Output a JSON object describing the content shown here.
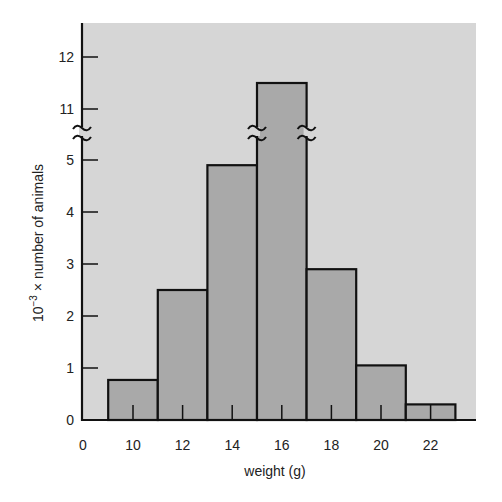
{
  "chart_data": {
    "type": "bar",
    "subtype": "histogram",
    "title": "",
    "xlabel": "weight (g)",
    "ylabel": "10⁻³ × number of animals",
    "ylabel_parts": {
      "base": "10",
      "exponent": "−3",
      "rest": " × number of animals"
    },
    "x_tick_labels": [
      "0",
      "10",
      "12",
      "14",
      "16",
      "18",
      "20",
      "22"
    ],
    "y_tick_labels": [
      "0",
      "1",
      "2",
      "3",
      "4",
      "5",
      "11",
      "12"
    ],
    "y_axis_break": {
      "from": 5,
      "to": 11,
      "note": "broken axis between 5 and 11"
    },
    "categories": [
      "9-11",
      "11-13",
      "13-15",
      "15-17",
      "17-19",
      "19-21",
      "21-23"
    ],
    "bin_centers": [
      10,
      12,
      14,
      16,
      18,
      20,
      22
    ],
    "bin_width": 2,
    "values": [
      0.77,
      2.5,
      4.9,
      11.5,
      2.9,
      1.05,
      0.3
    ],
    "ylim": [
      0,
      12.5
    ],
    "grid": false,
    "legend": null,
    "colors": {
      "plot_background": "#d6d6d6",
      "bar_fill": "#a9a9a9",
      "bar_stroke": "#111111",
      "axis": "#111111"
    }
  }
}
